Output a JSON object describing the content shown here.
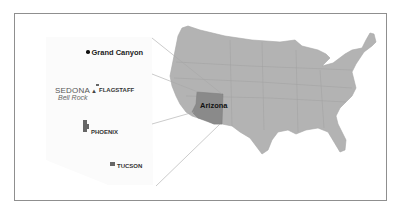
{
  "map": {
    "type": "inset-locator-map",
    "main_region": "Contiguous United States",
    "highlighted_state": {
      "label": "Arizona",
      "fill_color": "#8a8a8a"
    },
    "us_fill_color": "#b3b3b3",
    "state_border_color": "#9e9e9e",
    "frame_border_color": "#8f8f8f",
    "connector_line_color": "#a8a8a8",
    "inset": {
      "region": "Arizona",
      "places": [
        {
          "name": "Grand Canyon",
          "marker": "dot-icon"
        },
        {
          "name": "SEDONA",
          "marker": "mountain-triangle-icon",
          "sublabel": "Bell Rock"
        },
        {
          "name": "FLAGSTAFF",
          "marker": "city-icon"
        },
        {
          "name": "PHOENIX",
          "marker": "city-icon"
        },
        {
          "name": "TUCSON",
          "marker": "city-icon"
        }
      ]
    }
  }
}
